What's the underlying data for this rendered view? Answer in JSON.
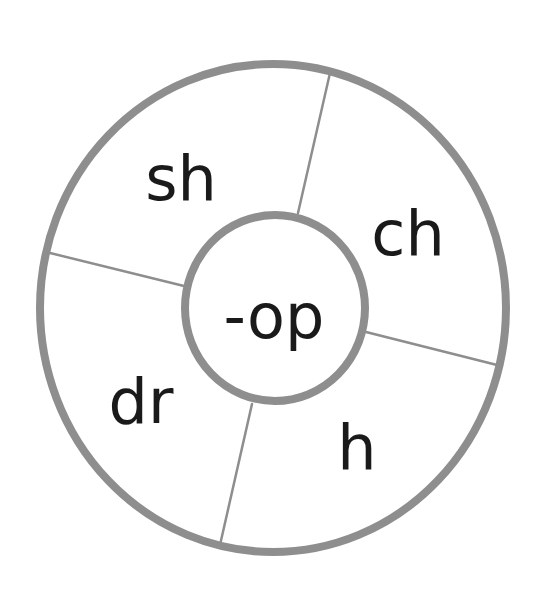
{
  "diagram": {
    "type": "word-family-wheel",
    "center": {
      "label": "-op"
    },
    "segments": [
      {
        "label": "sh"
      },
      {
        "label": "ch"
      },
      {
        "label": "h"
      },
      {
        "label": "dr"
      }
    ],
    "colors": {
      "ring_stroke": "#8e8e8e",
      "text": "#1a1a1a",
      "background": "#ffffff"
    }
  }
}
